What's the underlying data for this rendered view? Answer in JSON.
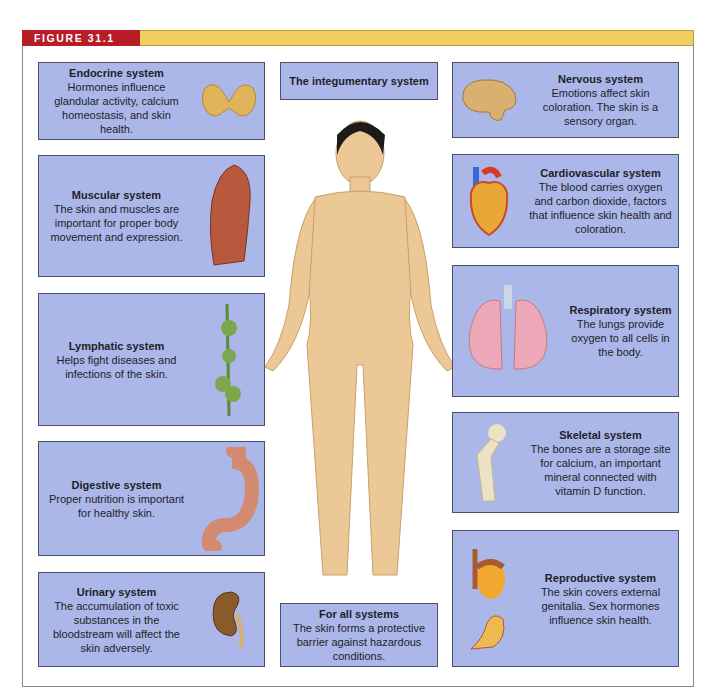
{
  "figure": {
    "label": "FIGURE 31.1",
    "colors": {
      "label_bg": "#b81c25",
      "bar": "#f1cf5e",
      "box": "#aab7e8"
    }
  },
  "center": {
    "top": {
      "title": "The integumentary system"
    },
    "bottom": {
      "title": "For all systems",
      "body": "The skin forms a protective barrier against hazardous conditions."
    },
    "illustration": "human-figure"
  },
  "left_boxes": [
    {
      "title": "Endocrine system",
      "body": "Hormones influence glandular activity, calcium homeostasis, and skin health.",
      "icon": "thyroid-gland-icon"
    },
    {
      "title": "Muscular system",
      "body": "The skin and muscles are important for proper body movement and expression.",
      "icon": "muscle-icon"
    },
    {
      "title": "Lymphatic system",
      "body": "Helps fight diseases and infections of the skin.",
      "icon": "lymph-node-icon"
    },
    {
      "title": "Digestive system",
      "body": "Proper nutrition is important for healthy skin.",
      "icon": "stomach-icon"
    },
    {
      "title": "Urinary system",
      "body": "The accumulation of toxic substances in the bloodstream will affect the skin adversely.",
      "icon": "kidney-icon"
    }
  ],
  "right_boxes": [
    {
      "title": "Nervous system",
      "body": "Emotions affect skin coloration. The skin is a sensory organ.",
      "icon": "brain-icon"
    },
    {
      "title": "Cardiovascular system",
      "body": "The blood carries oxygen and carbon dioxide, factors that influence skin health and coloration.",
      "icon": "heart-icon"
    },
    {
      "title": "Respiratory system",
      "body": "The lungs provide oxygen to all cells in the body.",
      "icon": "lungs-icon"
    },
    {
      "title": "Skeletal system",
      "body": "The bones are a storage site for calcium, an important mineral connected with vitamin D function.",
      "icon": "bone-icon"
    },
    {
      "title": "Reproductive system",
      "body": "The skin covers external genitalia. Sex hormones influence skin health.",
      "icon": "reproductive-organ-icon"
    }
  ]
}
